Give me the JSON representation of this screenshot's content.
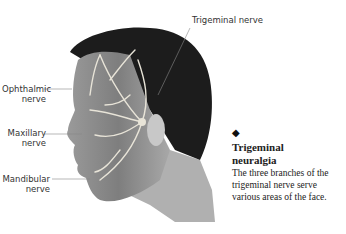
{
  "figure": {
    "labels": {
      "trigeminal": "Trigeminal nerve",
      "ophthalmic": [
        "Ophthalmic",
        "nerve"
      ],
      "maxillary": [
        "Maxillary",
        "nerve"
      ],
      "mandibular": [
        "Mandibular",
        "nerve"
      ]
    },
    "caption": {
      "bullet_icon": "diamond-icon",
      "title_line1": "Trigeminal",
      "title_line2": "neuralgia",
      "body": "The three branches of the trigeminal nerve serve various areas of the face."
    },
    "colors": {
      "hair": "#1c1c1c",
      "skin": "#8a8a8a",
      "nerve": "#e8e4d8",
      "leader": "#888888"
    }
  }
}
